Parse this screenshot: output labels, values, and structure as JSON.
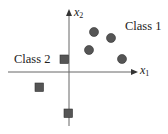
{
  "diagram": {
    "type": "2d-classification-scatter",
    "axes": {
      "x_label": "x",
      "x_sub": "1",
      "y_label": "x",
      "y_sub": "2",
      "origin_px": [
        69,
        72
      ],
      "color": "#555555"
    },
    "legend_labels": {
      "class1": "Class 1",
      "class2": "Class 2"
    },
    "class1_points": {
      "shape": "circle",
      "color": "#555555",
      "points_px": [
        [
          94,
          32
        ],
        [
          111,
          38
        ],
        [
          89,
          50
        ],
        [
          122,
          59
        ]
      ]
    },
    "class2_points": {
      "shape": "square",
      "color": "#555555",
      "points_px": [
        [
          64,
          59
        ],
        [
          39,
          87
        ],
        [
          68,
          113
        ]
      ]
    }
  }
}
